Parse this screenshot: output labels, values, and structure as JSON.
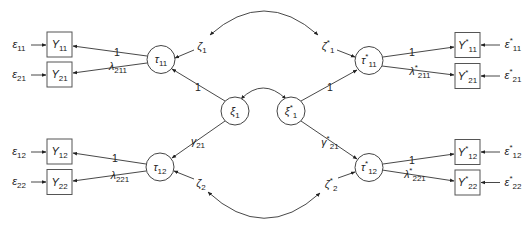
{
  "figure": {
    "type": "structural-equation-model path diagram",
    "colors": {
      "line": "#333333",
      "text": "#222222",
      "background": "#ffffff"
    }
  },
  "labels": {
    "y11": {
      "base": "Y",
      "sub": "11"
    },
    "y21": {
      "base": "Y",
      "sub": "21"
    },
    "y12": {
      "base": "Y",
      "sub": "12"
    },
    "y22": {
      "base": "Y",
      "sub": "22"
    },
    "ys11": {
      "base": "Y",
      "sup": "*",
      "sub": "11"
    },
    "ys21": {
      "base": "Y",
      "sup": "*",
      "sub": "21"
    },
    "ys12": {
      "base": "Y",
      "sup": "*",
      "sub": "12"
    },
    "ys22": {
      "base": "Y",
      "sup": "*",
      "sub": "22"
    },
    "e11": {
      "base": "ε",
      "sub": "11"
    },
    "e21": {
      "base": "ε",
      "sub": "21"
    },
    "e12": {
      "base": "ε",
      "sub": "12"
    },
    "e22": {
      "base": "ε",
      "sub": "22"
    },
    "es11": {
      "base": "ε",
      "sup": "*",
      "sub": "11"
    },
    "es21": {
      "base": "ε",
      "sup": "*",
      "sub": "21"
    },
    "es12": {
      "base": "ε",
      "sup": "*",
      "sub": "12"
    },
    "es22": {
      "base": "ε",
      "sup": "*",
      "sub": "22"
    },
    "tau11": {
      "base": "τ",
      "sub": "11"
    },
    "tau12": {
      "base": "τ",
      "sub": "12"
    },
    "taus11": {
      "base": "τ",
      "sup": "*",
      "sub": "11"
    },
    "taus12": {
      "base": "τ",
      "sup": "*",
      "sub": "12"
    },
    "xi1": {
      "base": "ξ",
      "sub": "1"
    },
    "xis1": {
      "base": "ξ",
      "sup": "*",
      "sub": "1"
    },
    "zeta1": {
      "base": "ζ",
      "sub": "1"
    },
    "zeta2": {
      "base": "ζ",
      "sub": "2"
    },
    "zetas1": {
      "base": "ζ",
      "sup": "*",
      "sub": "1"
    },
    "zetas2": {
      "base": "ζ",
      "sup": "*",
      "sub": "2"
    }
  },
  "paths": {
    "tau11_y11": "1",
    "tau11_y21": {
      "base": "λ",
      "sub": "211"
    },
    "tau12_y12": "1",
    "tau12_y22": {
      "base": "λ",
      "sub": "221"
    },
    "xi1_tau11": "1",
    "xi1_tau12": {
      "base": "γ",
      "sub": "21"
    },
    "xis1_taus11": "1",
    "xis1_taus12": {
      "base": "γ",
      "sup": "*",
      "sub": "21"
    },
    "taus11_ys11": "1",
    "taus11_ys21": {
      "base": "λ",
      "sup": "*",
      "sub": "211"
    },
    "taus12_ys12": "1",
    "taus12_ys22": {
      "base": "λ",
      "sup": "*",
      "sub": "221"
    }
  },
  "covariances": [
    {
      "from": "ζ1",
      "to": "ζ*1"
    },
    {
      "from": "ξ1",
      "to": "ξ*1"
    },
    {
      "from": "ζ2",
      "to": "ζ*2"
    }
  ]
}
